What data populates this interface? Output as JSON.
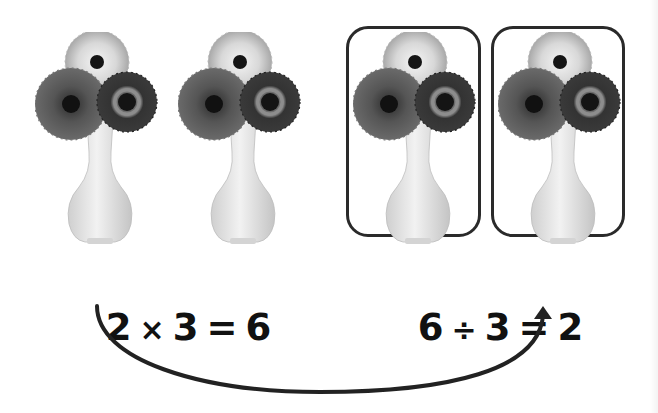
{
  "diagram": {
    "colors": {
      "background": "#ffffff",
      "ink": "#111111",
      "box_border": "#2a2a2a",
      "arrow": "#222222",
      "vase": "#e6e6e6",
      "flower_light": "#c9c9c9",
      "flower_mid": "#4a4a4a",
      "flower_dark": "#2e2e2e"
    },
    "vases": [
      {
        "id": 1,
        "flowers": 3,
        "grouped": false
      },
      {
        "id": 2,
        "flowers": 3,
        "grouped": false
      },
      {
        "id": 3,
        "flowers": 3,
        "grouped": true
      },
      {
        "id": 4,
        "flowers": 3,
        "grouped": true
      }
    ],
    "left_equation": {
      "a": "2",
      "operator": "×",
      "b": "3",
      "equals": "=",
      "result": "6"
    },
    "right_equation": {
      "a": "6",
      "operator": "÷",
      "b": "3",
      "equals": "=",
      "result": "2"
    },
    "arrow": {
      "from": "left_equation.a",
      "to": "right_equation.result",
      "icon": "curved-arrow-icon"
    }
  }
}
